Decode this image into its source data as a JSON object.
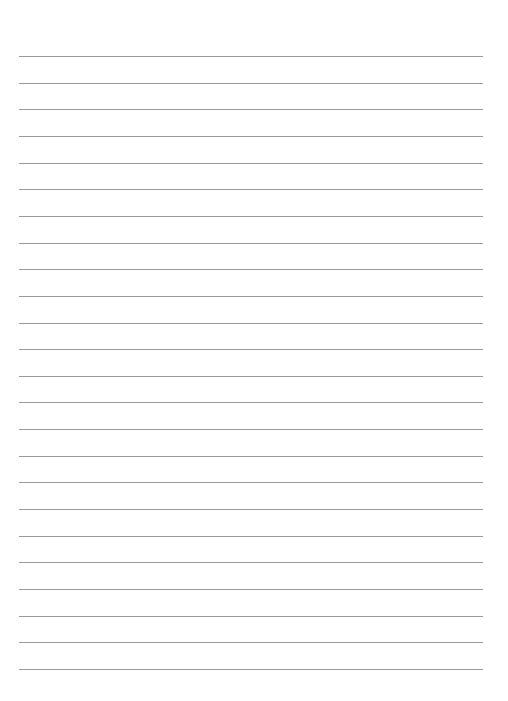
{
  "page": {
    "type": "lined-paper",
    "background": "#ffffff",
    "line_color": "#9a9a9a",
    "line_count": 24,
    "first_line_y": 56,
    "line_spacing": 26.65,
    "line_left": 19,
    "line_width": 464
  }
}
